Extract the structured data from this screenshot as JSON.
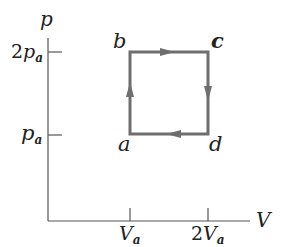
{
  "diagram": {
    "type": "pV cycle",
    "axes": {
      "y_label": "p",
      "x_label": "V",
      "y_ticks": [
        {
          "coef": "2",
          "symbol": "p",
          "sub": "a"
        },
        {
          "coef": "",
          "symbol": "p",
          "sub": "a"
        }
      ],
      "x_ticks": [
        {
          "coef": "",
          "symbol": "V",
          "sub": "a"
        },
        {
          "coef": "2",
          "symbol": "V",
          "sub": "a"
        }
      ]
    },
    "points": [
      {
        "name": "a",
        "label": "a",
        "V": "Va",
        "p": "pa"
      },
      {
        "name": "b",
        "label": "b",
        "V": "Va",
        "p": "2pa"
      },
      {
        "name": "c",
        "label": "c",
        "V": "2Va",
        "p": "2pa"
      },
      {
        "name": "d",
        "label": "d",
        "V": "2Va",
        "p": "pa"
      }
    ],
    "path_order": [
      "a",
      "b",
      "c",
      "d",
      "a"
    ],
    "colors": {
      "cycle": "#6e6e6e",
      "axes": "#555555",
      "text": "#222222"
    }
  }
}
